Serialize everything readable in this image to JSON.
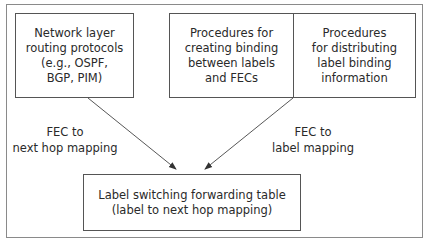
{
  "diagram": {
    "boxes": {
      "routing": "Network layer\nrouting protocols\n(e.g., OSPF,\nBGP, PIM)",
      "binding_create": "Procedures for\ncreating binding\nbetween labels\nand FECs",
      "binding_distribute": "Procedures\nfor distributing\nlabel binding\ninformation",
      "forwarding_table": "Label switching forwarding table\n(label to next hop mapping)"
    },
    "edges": {
      "left": "FEC to\nnext hop mapping",
      "right": "FEC to\nlabel mapping"
    },
    "colors": {
      "line": "#555555",
      "frame": "#8a8a8a"
    }
  }
}
